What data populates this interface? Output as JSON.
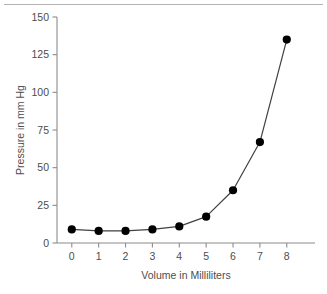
{
  "figure": {
    "background_color": "#ffffff",
    "rule_color": "#b3b3b3",
    "axis_color": "#8c8c8c",
    "text_color": "#4d4d4d",
    "line_color": "#404040",
    "marker_color": "#000000"
  },
  "chart_data": {
    "type": "line",
    "title": "",
    "xlabel": "Volume in Milliliters",
    "ylabel": "Pressure in mm Hg",
    "x": [
      0,
      1,
      2,
      3,
      4,
      5,
      6,
      7,
      8
    ],
    "values": [
      9,
      8,
      8,
      9,
      11,
      17.5,
      35,
      67,
      135
    ],
    "xticks": [
      0,
      1,
      2,
      3,
      4,
      5,
      6,
      7,
      8
    ],
    "xtick_labels": [
      "0",
      "1",
      "2",
      "3",
      "4",
      "5",
      "6",
      "7",
      "8"
    ],
    "yticks": [
      0,
      25,
      50,
      75,
      100,
      125,
      150
    ],
    "ytick_labels": [
      "0",
      "25",
      "50",
      "75",
      "100",
      "125",
      "150"
    ],
    "xlim": [
      -0.55,
      9.05
    ],
    "ylim": [
      0,
      150
    ],
    "grid": false,
    "legend": null,
    "marker": "filled-circle",
    "series_name": "pressure-vs-volume"
  }
}
